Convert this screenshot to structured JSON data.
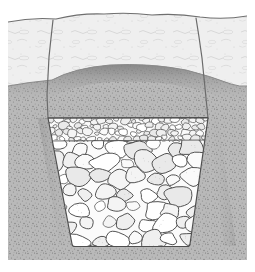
{
  "figure": {
    "kind": "cross-section-illustration",
    "subject": "rock-filled trench cross section",
    "title": "Rock-filled trench cross section",
    "style": "pen-and-ink stipple line drawing, grayscale",
    "canvas": {
      "width": 255,
      "height": 272
    },
    "plate": {
      "x": 8,
      "y": 11,
      "width": 239,
      "height": 249
    },
    "margin_color": "#ffffff"
  },
  "layers": [
    {
      "id": "topsoil",
      "name": "Topsoil / surface layer",
      "fill_color": "#eeeeee",
      "texture": "faint squiggle marks",
      "top_y": 11,
      "bottom_y": 82,
      "description": "Light-toned surface soil horizon with irregular ground surface"
    },
    {
      "id": "subsoil",
      "name": "Subsoil / native ground",
      "fill_color": "#b4b4b4",
      "texture": "dense stipple",
      "top_y": 82,
      "bottom_y": 260,
      "description": "Darker stippled native soil surrounding the excavation"
    }
  ],
  "trench": {
    "id": "trench-excavation",
    "name": "Excavated trench",
    "shape": "trapezoid, battered side walls, flat bottom",
    "top_left_x": 48,
    "top_right_x": 208,
    "bottom_left_x": 72,
    "bottom_right_x": 190,
    "fill_top_y": 118,
    "bottom_y": 246,
    "wall_line_color": "#555555"
  },
  "cut_lines": {
    "name": "Excavation cut lines through topsoil",
    "left": {
      "x_top": 53,
      "y_top": 20,
      "x_bottom": 48,
      "y_bottom": 118
    },
    "right": {
      "x_top": 196,
      "y_top": 18,
      "x_bottom": 208,
      "y_bottom": 118
    },
    "color": "#6b6b6b"
  },
  "ground_surface": {
    "name": "Ground surface line",
    "color": "#777777",
    "note": "undulating, slightly mounded above the backfilled trench"
  },
  "horizon_line": {
    "name": "Topsoil / subsoil horizon",
    "color": "#8a8a8a",
    "note": "dips at the sides and arches upward over the trench"
  },
  "fill_zones": [
    {
      "id": "fine-aggregate",
      "name": "Fine aggregate cap",
      "grain": "small angular aggregate",
      "top_y": 118,
      "bottom_y": 141,
      "stone_fill": "#f6f6f6",
      "stone_outline": "#4a4a4a",
      "approx_stone_size_px": 8,
      "stone_count": 210
    },
    {
      "id": "coarse-rock",
      "name": "Coarse rock fill",
      "grain": "large rounded to sub-angular stones",
      "top_y": 141,
      "bottom_y": 246,
      "stone_fill": "#f4f4f4",
      "stone_outline": "#4a4a4a",
      "approx_stone_size_px": 20,
      "stone_count": 125
    }
  ],
  "palette": {
    "paper": "#ffffff",
    "topsoil": "#eeeeee",
    "subsoil": "#b4b4b4",
    "stone_fill": "#f5f5f5",
    "stone_outline": "#4a4a4a",
    "line": "#555555"
  }
}
